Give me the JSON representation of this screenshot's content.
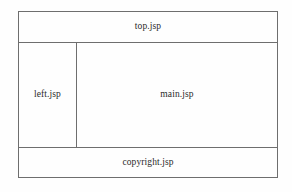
{
  "diagram": {
    "type": "jsp-frameset-layout",
    "colors": {
      "border": "#6e6e6e",
      "background": "#fefefe",
      "text": "#2a2a2a"
    },
    "regions": {
      "top": {
        "label": "top.jsp"
      },
      "left": {
        "label": "left.jsp"
      },
      "main": {
        "label": "main.jsp"
      },
      "bottom": {
        "label": "copyright.jsp"
      }
    }
  }
}
